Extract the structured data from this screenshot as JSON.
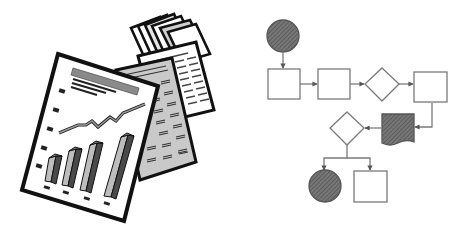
{
  "scene": {
    "description": "Clip-art illustration: stack of report papers with a bar chart and line graph on the left, a flowchart diagram on the right",
    "colors": {
      "background": "#ffffff",
      "outline": "#111111",
      "paper": "#ffffff",
      "paper_gray": "#c8c8c8",
      "bar_light": "#bdbdbd",
      "bar_dark": "#4a4a4a",
      "title_bar": "#8a8a8a",
      "hatch_fill": "#6e6e6e",
      "flow_line": "#7a7a7a"
    }
  },
  "report_papers": {
    "front_sheet": {
      "bars": 4,
      "bullet_marks": 5,
      "has_line_graph": true,
      "has_title_bar": true,
      "text_lines": 3
    },
    "back_sheets": [
      "gray-ruled-sheet",
      "white-ruled-sheet",
      "stacked-small-sheets"
    ]
  },
  "flowchart": {
    "nodes": [
      {
        "id": "start",
        "shape": "circle",
        "filled": true
      },
      {
        "id": "step1",
        "shape": "rectangle",
        "filled": false
      },
      {
        "id": "step2",
        "shape": "rectangle",
        "filled": false
      },
      {
        "id": "decision1",
        "shape": "diamond",
        "filled": false
      },
      {
        "id": "step3",
        "shape": "rectangle",
        "filled": false
      },
      {
        "id": "document",
        "shape": "document",
        "filled": true
      },
      {
        "id": "decision2",
        "shape": "diamond",
        "filled": false
      },
      {
        "id": "end",
        "shape": "circle",
        "filled": true
      },
      {
        "id": "step4",
        "shape": "rectangle",
        "filled": false
      }
    ],
    "edges": [
      [
        "start",
        "step1"
      ],
      [
        "step1",
        "step2"
      ],
      [
        "step2",
        "decision1"
      ],
      [
        "decision1",
        "step3"
      ],
      [
        "step3",
        "document"
      ],
      [
        "document",
        "decision2"
      ],
      [
        "decision2",
        "end"
      ],
      [
        "decision2",
        "step4"
      ]
    ]
  }
}
